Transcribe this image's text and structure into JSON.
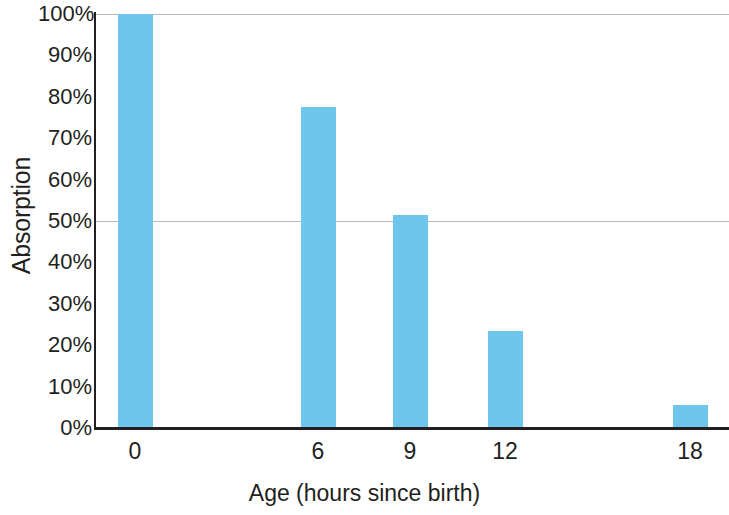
{
  "chart_data": {
    "type": "bar",
    "title": "",
    "xlabel": "Age (hours since birth)",
    "ylabel": "Absorption",
    "categories": [
      "0",
      "6",
      "9",
      "12",
      "18"
    ],
    "values": [
      100,
      77.5,
      51.5,
      23.5,
      5.5
    ],
    "value_labels": [
      "100%",
      "77.5%",
      "51.5%",
      "23.5%",
      "5.5%"
    ],
    "ylim": [
      0,
      100
    ],
    "ytick_labels": [
      "100%",
      "90%",
      "80%",
      "70%",
      "60%",
      "50%",
      "40%",
      "30%",
      "20%",
      "10%",
      "0%"
    ],
    "ytick_values": [
      100,
      90,
      80,
      70,
      60,
      50,
      40,
      30,
      20,
      10,
      0
    ],
    "gridlines": [
      100,
      50
    ],
    "grid": true,
    "legend": "none",
    "bar_color": "#6ec6ed",
    "axis_color": "#231f20",
    "grid_color": "#b9b9b9",
    "background": "#ffffff",
    "bar_positions_px": [
      135,
      318,
      410,
      505,
      690
    ],
    "bar_width_px": 35
  }
}
